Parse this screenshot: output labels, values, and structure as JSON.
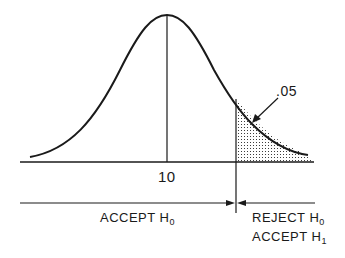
{
  "diagram": {
    "type": "normal-distribution-hypothesis-test",
    "mean_label": "10",
    "tail_area_label": ".05",
    "regions": {
      "accept": {
        "text": "ACCEPT H",
        "sub": "0"
      },
      "reject": {
        "text": "REJECT H",
        "sub": "0"
      },
      "reject_alt": {
        "text": "ACCEPT H",
        "sub": "1"
      }
    },
    "colors": {
      "ink": "#1a1a1a",
      "background": "#ffffff"
    }
  }
}
